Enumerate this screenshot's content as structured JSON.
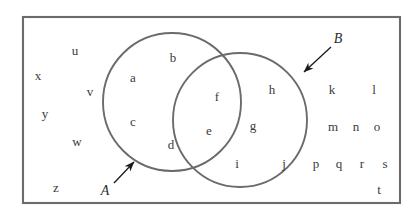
{
  "figure": {
    "type": "venn-diagram",
    "universe_rect": {
      "x": 23,
      "y": 17,
      "width": 377,
      "height": 186
    },
    "colors": {
      "background": "#ffffff",
      "rect_stroke": "#6b6b6b",
      "circle_stroke": "#6b6b6b",
      "text": "#3a3a3a",
      "arrow": "#1a1a1a"
    }
  },
  "sets": {
    "A": {
      "label": "A",
      "circle": {
        "cx": 172,
        "cy": 102,
        "r": 69
      },
      "arrow": {
        "from_x": 114,
        "from_y": 183,
        "to_x": 134,
        "to_y": 162
      },
      "label_pos": {
        "x": 105,
        "y": 191
      }
    },
    "B": {
      "label": "B",
      "circle": {
        "cx": 240,
        "cy": 120,
        "r": 67
      },
      "arrow": {
        "from_x": 331,
        "from_y": 47,
        "to_x": 304,
        "to_y": 72
      },
      "label_pos": {
        "x": 338,
        "y": 39
      }
    }
  },
  "elements": [
    {
      "label": "u",
      "x": 75,
      "y": 50,
      "region": "outside"
    },
    {
      "label": "x",
      "x": 38,
      "y": 75,
      "region": "outside"
    },
    {
      "label": "v",
      "x": 90,
      "y": 91,
      "region": "outside"
    },
    {
      "label": "y",
      "x": 45,
      "y": 113,
      "region": "outside"
    },
    {
      "label": "w",
      "x": 77,
      "y": 141,
      "region": "outside"
    },
    {
      "label": "z",
      "x": 56,
      "y": 187,
      "region": "outside"
    },
    {
      "label": "a",
      "x": 133,
      "y": 77,
      "region": "A-only"
    },
    {
      "label": "b",
      "x": 173,
      "y": 57,
      "region": "A-only"
    },
    {
      "label": "c",
      "x": 133,
      "y": 121,
      "region": "A-only"
    },
    {
      "label": "d",
      "x": 171,
      "y": 144,
      "region": "A-only"
    },
    {
      "label": "f",
      "x": 217,
      "y": 96,
      "region": "A-and-B"
    },
    {
      "label": "e",
      "x": 209,
      "y": 130,
      "region": "A-and-B"
    },
    {
      "label": "h",
      "x": 272,
      "y": 89,
      "region": "B-only"
    },
    {
      "label": "g",
      "x": 253,
      "y": 125,
      "region": "B-only"
    },
    {
      "label": "i",
      "x": 237,
      "y": 163,
      "region": "B-only"
    },
    {
      "label": "j",
      "x": 284,
      "y": 163,
      "region": "B-only"
    },
    {
      "label": "k",
      "x": 332,
      "y": 89,
      "region": "outside"
    },
    {
      "label": "l",
      "x": 374,
      "y": 89,
      "region": "outside"
    },
    {
      "label": "m",
      "x": 333,
      "y": 126,
      "region": "outside"
    },
    {
      "label": "n",
      "x": 356,
      "y": 126,
      "region": "outside"
    },
    {
      "label": "o",
      "x": 377,
      "y": 126,
      "region": "outside"
    },
    {
      "label": "p",
      "x": 316,
      "y": 163,
      "region": "outside"
    },
    {
      "label": "q",
      "x": 339,
      "y": 163,
      "region": "outside"
    },
    {
      "label": "r",
      "x": 362,
      "y": 163,
      "region": "outside"
    },
    {
      "label": "s",
      "x": 385,
      "y": 163,
      "region": "outside"
    },
    {
      "label": "t",
      "x": 379,
      "y": 189,
      "region": "outside"
    }
  ]
}
